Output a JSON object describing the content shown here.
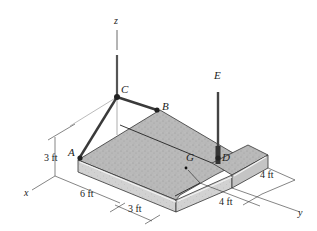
{
  "figure": {
    "colors": {
      "slab_top": "#b8b8b8",
      "slab_side": "#d6d6d6",
      "slab_edge_highlight": "#f2f2f2",
      "cable": "#3a3a3a",
      "axis": "#333333",
      "text": "#222222"
    },
    "axes": {
      "x": "x",
      "y": "y",
      "z": "z"
    },
    "points": {
      "A": "A",
      "B": "B",
      "C": "C",
      "D": "D",
      "E": "E",
      "G": "G"
    },
    "dimensions": {
      "height": "3 ft",
      "x_length": "6 ft",
      "x_offset": "3 ft",
      "y_length_1": "4 ft",
      "y_length_2": "4 ft"
    }
  }
}
